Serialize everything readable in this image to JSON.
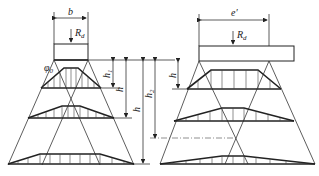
{
  "diagram": {
    "left": {
      "width_label": "b",
      "load_label": "R",
      "load_sub": "d",
      "angle_label": "φ",
      "angle_sub": "0",
      "dims": [
        {
          "label": "h",
          "sub": "1"
        },
        {
          "label": "h",
          "sub": ""
        },
        {
          "label": "h",
          "sub": ""
        },
        {
          "label": "h",
          "sub": "2"
        }
      ]
    },
    "right": {
      "width_label": "e′",
      "load_label": "R",
      "load_sub": "d",
      "dims": [
        {
          "label": "h",
          "sub": ""
        }
      ]
    }
  }
}
